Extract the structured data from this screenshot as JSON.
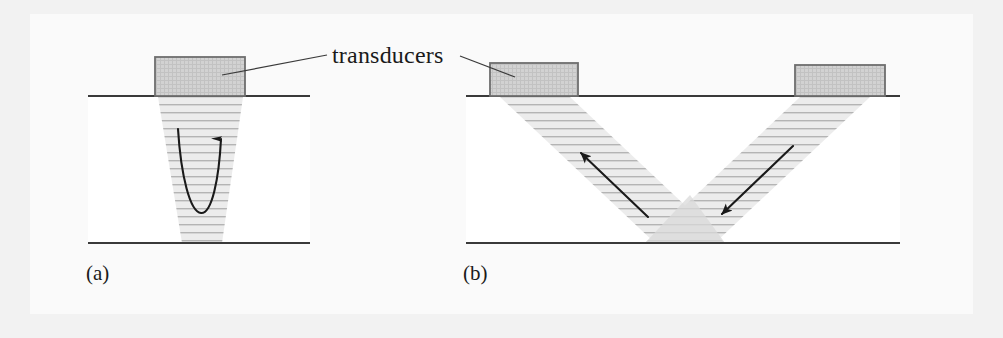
{
  "figure": {
    "caption_labels": {
      "panel_a": "(a)",
      "panel_b": "(b)"
    },
    "annotations": {
      "transducers_label": "transducers"
    },
    "colors": {
      "page_background": "#f2f2f2",
      "plate_background": "#fafafa",
      "specimen_fill": "#ffffff",
      "transducer_fill": "#cfcfcf",
      "transducer_border": "#6e6e6e",
      "surface_line": "#3a3a3a",
      "beam_fill": "#e8e8e8",
      "beam_hatch": "#b4b4b4",
      "arrow": "#1a1a1a",
      "leader_line": "#3a3a3a",
      "text": "#1a1a1a"
    },
    "panel_a": {
      "name": "single-transducer-pulse-echo",
      "transducer_count": 1,
      "beam_shape": "downward-tapering-trapezoid",
      "beam_hatch_orientation": "horizontal",
      "arrow_description": "u-shaped-curved-arrow-pointing-up",
      "surface_line_x": [
        88,
        310
      ],
      "surface_line_y": 96,
      "bottom_line_y": 243,
      "transducer_rect": [
        155,
        57,
        90,
        39
      ],
      "beam_top_x": [
        158,
        243
      ],
      "beam_bottom_x": [
        182,
        222
      ],
      "beam_bottom_y": 243
    },
    "panel_b": {
      "name": "dual-transducer-pitch-catch",
      "transducer_count": 2,
      "beam_shape": "two-slanted-beams-forming-v",
      "beam_hatch_orientation": "horizontal",
      "arrow_descriptions": [
        "straight-arrow-pointing-up-left",
        "straight-arrow-pointing-down-left"
      ],
      "surface_line_x": [
        466,
        900
      ],
      "surface_line_y": 96,
      "bottom_line_y": 243,
      "transducer_left_rect": [
        490,
        63,
        88,
        33
      ],
      "transducer_right_rect": [
        795,
        65,
        90,
        31
      ],
      "beam_left_top_x": [
        500,
        570
      ],
      "beam_left_bottom_x": [
        655,
        725
      ],
      "beam_right_top_x": [
        800,
        870
      ],
      "beam_right_bottom_x": [
        645,
        715
      ]
    }
  }
}
